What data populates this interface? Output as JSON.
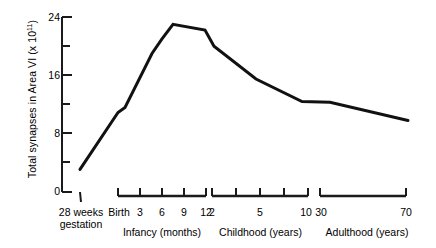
{
  "chart_data": {
    "type": "line",
    "title": "",
    "ylabel_main": "Total synapses in Area VI (x 10",
    "ylabel_exponent": "11",
    "ylabel_close": ")",
    "xlabel": "",
    "ylim": [
      0,
      24
    ],
    "yticks": [
      0,
      4,
      8,
      12,
      16,
      20,
      24
    ],
    "ytick_labels": [
      "0",
      "",
      "8",
      "",
      "16",
      "",
      "24"
    ],
    "grid": false,
    "legend": null,
    "axis_style": "segmented-broken-x-axis",
    "x_segments": [
      {
        "name": "gestation",
        "group_label": "",
        "tick_labels": [
          "28 weeks\ngestation"
        ],
        "ticks": [
          "28 weeks gestation"
        ]
      },
      {
        "name": "infancy",
        "group_label": "Infancy (months)",
        "ticks": [
          "Birth",
          "3",
          "6",
          "9",
          "12"
        ]
      },
      {
        "name": "childhood",
        "group_label": "Childhood (years)",
        "ticks": [
          "2",
          "",
          "5",
          "",
          "10"
        ]
      },
      {
        "name": "adulthood",
        "group_label": "Adulthood (years)",
        "ticks": [
          "30",
          "70"
        ]
      }
    ],
    "x_labels_flat": [
      "28 weeks gestation",
      "Birth",
      "3",
      "6",
      "9",
      "12",
      "2",
      "5",
      "10",
      "30",
      "70"
    ],
    "series": [
      {
        "name": "Total synapses in Area V1",
        "points": [
          {
            "x_label": "28 weeks gestation",
            "value": 3.1
          },
          {
            "x_label": "Birth",
            "value": 10.9
          },
          {
            "x_label": "1 month",
            "value": 11.6
          },
          {
            "x_label": "4 months",
            "value": 19.0
          },
          {
            "x_label": "6 months",
            "value": 21.0
          },
          {
            "x_label": "9 months",
            "value": 23.0
          },
          {
            "x_label": "12 months",
            "value": 22.2
          },
          {
            "x_label": "2 years",
            "value": 20.0
          },
          {
            "x_label": "5 years",
            "value": 15.5
          },
          {
            "x_label": "10 years",
            "value": 12.4
          },
          {
            "x_label": "30 years",
            "value": 12.3
          },
          {
            "x_label": "70 years",
            "value": 9.8
          }
        ]
      }
    ],
    "annotations": [],
    "line_color": "#111111",
    "line_width_px": 3
  },
  "gestation": {
    "line1": "28 weeks",
    "line2": "gestation"
  },
  "axis": {
    "y_label_24": "24",
    "y_label_16": "16",
    "y_label_8": "8",
    "y_label_0": "0"
  },
  "x": {
    "birth": "Birth",
    "m3": "3",
    "m6": "6",
    "m9": "9",
    "m12": "12",
    "y2": "2",
    "y5": "5",
    "y10": "10",
    "a30": "30",
    "a70": "70",
    "infancy": "Infancy (months)",
    "childhood": "Childhood (years)",
    "adulthood": "Adulthood (years)"
  }
}
